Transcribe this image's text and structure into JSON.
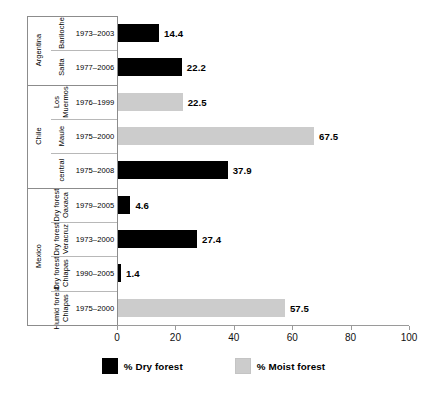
{
  "chart_data": {
    "type": "bar",
    "orientation": "horizontal",
    "title": "",
    "xlabel": "",
    "ylabel": "",
    "xlim": [
      0,
      100
    ],
    "xticks": [
      0,
      20,
      40,
      60,
      80,
      100
    ],
    "grid": false,
    "legend_position": "bottom",
    "legend": [
      {
        "name": "% Dry forest",
        "color": "#000000"
      },
      {
        "name": "% Moist forest",
        "color": "#cccccc"
      }
    ],
    "series": [
      {
        "name": "% Dry forest",
        "color": "#000000"
      },
      {
        "name": "% Moist forest",
        "color": "#cccccc"
      }
    ],
    "categories": [
      "Argentina / Bariloche / 1973-2003",
      "Argentina / Salta / 1977-2006",
      "Chile / Los Muermos / 1976-1999",
      "Chile / Maule / 1975-2000",
      "Chile / central / 1975-2008",
      "Mexico / Dry forest Oaxaca / 1979-2005",
      "Mexico / Dry forest Veracruz / 1973-2000",
      "Mexico / Dry forest Chiapas / 1990-2005",
      "Mexico / Humid forest Chiapas / 1975-2000"
    ],
    "values": [
      14.4,
      22.2,
      22.5,
      67.5,
      37.9,
      4.6,
      27.4,
      1.4,
      57.5
    ],
    "rows": [
      {
        "country": "Argentina",
        "country_span": 2,
        "site": "Bariloche",
        "site_lines": [
          "Bariloche"
        ],
        "years": "1973–2003",
        "value": 14.4,
        "label": "14.4",
        "series": "% Dry forest",
        "color": "#000000"
      },
      {
        "country": "Argentina",
        "country_span": 0,
        "site": "Salta",
        "site_lines": [
          "Salta"
        ],
        "years": "1977–2006",
        "value": 22.2,
        "label": "22.2",
        "series": "% Dry forest",
        "color": "#000000"
      },
      {
        "country": "Chile",
        "country_span": 3,
        "site": "Los Muermos",
        "site_lines": [
          "Los",
          "Muermos"
        ],
        "years": "1976–1999",
        "value": 22.5,
        "label": "22.5",
        "series": "% Moist forest",
        "color": "#cccccc"
      },
      {
        "country": "Chile",
        "country_span": 0,
        "site": "Maule",
        "site_lines": [
          "Maule"
        ],
        "years": "1975–2000",
        "value": 67.5,
        "label": "67.5",
        "series": "% Moist forest",
        "color": "#cccccc"
      },
      {
        "country": "Chile",
        "country_span": 0,
        "site": "central",
        "site_lines": [
          "central"
        ],
        "years": "1975–2008",
        "value": 37.9,
        "label": "37.9",
        "series": "% Dry forest",
        "color": "#000000"
      },
      {
        "country": "Mexico",
        "country_span": 4,
        "site": "Dry forest Oaxaca",
        "site_lines": [
          "Dry forest",
          "Oaxaca"
        ],
        "years": "1979–2005",
        "value": 4.6,
        "label": "4.6",
        "series": "% Dry forest",
        "color": "#000000"
      },
      {
        "country": "Mexico",
        "country_span": 0,
        "site": "Dry forest Veracruz",
        "site_lines": [
          "Dry forest",
          "Veracruz"
        ],
        "years": "1973–2000",
        "value": 27.4,
        "label": "27.4",
        "series": "% Dry forest",
        "color": "#000000"
      },
      {
        "country": "Mexico",
        "country_span": 0,
        "site": "Dry forest Chiapas",
        "site_lines": [
          "Dry forest",
          "Chiapas"
        ],
        "years": "1990–2005",
        "value": 1.4,
        "label": "1.4",
        "series": "% Dry forest",
        "color": "#000000"
      },
      {
        "country": "Mexico",
        "country_span": 0,
        "site": "Humid forest Chiapas",
        "site_lines": [
          "Humid forest",
          "Chiapas"
        ],
        "years": "1975–2000",
        "value": 57.5,
        "label": "57.5",
        "series": "% Moist forest",
        "color": "#cccccc"
      }
    ],
    "country_groups": [
      {
        "label": "Argentina",
        "rows": 2
      },
      {
        "label": "Chile",
        "rows": 3
      },
      {
        "label": "Mexico",
        "rows": 4
      }
    ]
  },
  "axis": {
    "ticks": [
      "0",
      "20",
      "40",
      "60",
      "80",
      "100"
    ]
  },
  "legend": {
    "items": [
      {
        "label": "% Dry forest",
        "color": "#000000"
      },
      {
        "label": "% Moist forest",
        "color": "#cccccc"
      }
    ]
  },
  "colors": {
    "dry_forest": "#000000",
    "moist_forest": "#cccccc",
    "rule": "#8c8c8c",
    "rule_light": "#b8b8b8",
    "axis": "#9a9a9a"
  }
}
